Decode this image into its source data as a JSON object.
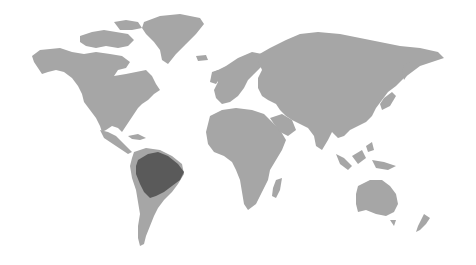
{
  "map": {
    "type": "world-map",
    "background": "#ffffff",
    "land_color": "#a6a6a6",
    "highlight_color": "#5a5a5a",
    "highlighted_region": "Amazon basin (northern South America)",
    "continents": [
      "North America",
      "Greenland",
      "South America",
      "Europe",
      "Africa",
      "Asia",
      "Australia",
      "New Zealand",
      "Madagascar"
    ]
  }
}
